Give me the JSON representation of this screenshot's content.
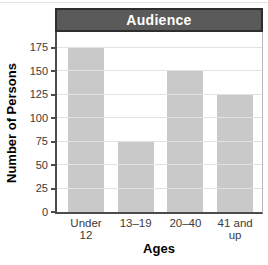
{
  "chart_data": {
    "type": "bar",
    "title": "Audience",
    "xlabel": "Ages",
    "ylabel": "Number of Persons",
    "categories": [
      "Under 12",
      "13–19",
      "20–40",
      "41 and up"
    ],
    "category_lines": [
      [
        "Under",
        "12"
      ],
      [
        "13–19"
      ],
      [
        "20–40"
      ],
      [
        "41 and",
        "up"
      ]
    ],
    "values": [
      175,
      75,
      150,
      125
    ],
    "yticks": [
      0,
      25,
      50,
      75,
      100,
      125,
      150,
      175
    ],
    "ylim": [
      0,
      192
    ],
    "grid": true,
    "legend": false,
    "colors": {
      "bar_fill": "#c9c9c9",
      "gridline": "#e2e2e2",
      "axis_line": "#4c4c4c",
      "title_bar_fill": "#5a5a5a",
      "title_bar_border": "#2e2e2e",
      "title_text": "#ffffff",
      "tick_text": "#3b3b3b",
      "label_text": "#000000"
    }
  }
}
